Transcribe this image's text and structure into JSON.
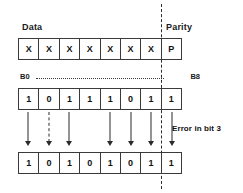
{
  "figure": {
    "type": "parity-error-detection-diagram",
    "labels": {
      "data": "Data",
      "parity": "Parity"
    },
    "bit_span": {
      "start": "B0",
      "end": "B8"
    },
    "annotation": {
      "error_text": "Error in bit 3"
    }
  },
  "rows": {
    "template": {
      "name": "frame-template",
      "cells": [
        "X",
        "X",
        "X",
        "X",
        "X",
        "X",
        "X",
        "P"
      ]
    },
    "transmitted": {
      "name": "transmitted-bits",
      "cells": [
        "1",
        "0",
        "1",
        "1",
        "1",
        "0",
        "1",
        "1"
      ]
    },
    "received": {
      "name": "received-bits",
      "cells": [
        "1",
        "0",
        "1",
        "0",
        "1",
        "0",
        "1",
        "1"
      ]
    }
  },
  "arrows": {
    "styles": [
      "solid",
      "dashed",
      "solid",
      "none",
      "solid",
      "solid",
      "solid",
      "solid"
    ]
  },
  "colors": {
    "ink": "#2b2b2b",
    "text": "#111111",
    "background": "#ffffff"
  }
}
